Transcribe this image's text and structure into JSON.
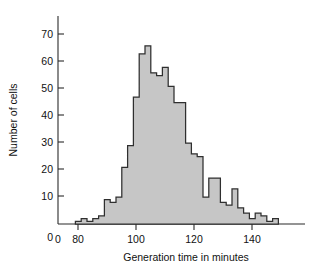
{
  "chart_data": {
    "type": "bar",
    "title": "",
    "subtitle": "",
    "xlabel": "Generation time in minutes",
    "ylabel": "Number of cells",
    "xlim": [
      76,
      154
    ],
    "ylim": [
      0,
      75
    ],
    "xticks": [
      0,
      80,
      100,
      120,
      140
    ],
    "xtick_labels": [
      "0",
      "80",
      "100",
      "120",
      "140"
    ],
    "yticks": [
      0,
      10,
      20,
      30,
      40,
      50,
      60,
      70
    ],
    "ytick_labels": [
      "0",
      "10",
      "20",
      "30",
      "40",
      "50",
      "60",
      "70"
    ],
    "grid": false,
    "legend": false,
    "bin_width": 2,
    "bin_starts": [
      82,
      84,
      86,
      88,
      90,
      92,
      94,
      96,
      98,
      100,
      102,
      104,
      106,
      108,
      110,
      112,
      114,
      116,
      118,
      120,
      122,
      124,
      126,
      128,
      130,
      132,
      134,
      136,
      138,
      140,
      142,
      144,
      146,
      148,
      150
    ],
    "categories": [
      "82-84",
      "84-86",
      "86-88",
      "88-90",
      "90-92",
      "92-94",
      "94-96",
      "96-98",
      "98-100",
      "100-102",
      "102-104",
      "104-106",
      "106-108",
      "108-110",
      "110-112",
      "112-114",
      "114-116",
      "116-118",
      "118-120",
      "120-122",
      "122-124",
      "124-126",
      "126-128",
      "128-130",
      "130-132",
      "132-134",
      "134-136",
      "136-138",
      "138-140",
      "140-142",
      "142-144",
      "144-146",
      "146-148",
      "148-150",
      "150-152"
    ],
    "values": [
      1,
      2,
      1,
      2,
      3,
      9,
      8,
      10,
      21,
      29,
      47,
      63,
      66,
      56,
      55,
      58,
      51,
      45,
      45,
      30,
      26,
      25,
      10,
      17,
      17,
      8,
      7,
      13,
      6,
      4,
      2,
      4,
      3,
      1,
      2
    ],
    "series": [
      {
        "name": "Number of cells",
        "values": [
          1,
          2,
          1,
          2,
          3,
          9,
          8,
          10,
          21,
          29,
          47,
          63,
          66,
          56,
          55,
          58,
          51,
          45,
          45,
          30,
          26,
          25,
          10,
          17,
          17,
          8,
          7,
          13,
          6,
          4,
          2,
          4,
          3,
          1,
          2
        ]
      }
    ],
    "peak_value": 66,
    "peak_bin": "106-108",
    "fill_color": "#c6c6c6",
    "edge_color": "#2f2f2f",
    "axis_color": "#2b2b2b"
  }
}
